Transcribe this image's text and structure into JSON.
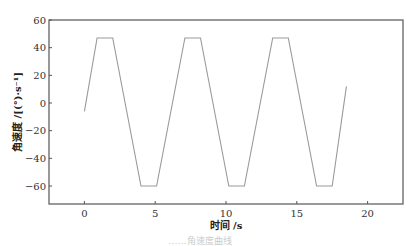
{
  "chart_data": {
    "type": "line",
    "title": "",
    "xlabel": "时间 /s",
    "ylabel": "角速度 /[(°)·s⁻¹]",
    "xlim": [
      -2.5,
      22.5
    ],
    "ylim": [
      -73,
      60
    ],
    "xticks": [
      0,
      5,
      10,
      15,
      20
    ],
    "yticks": [
      60,
      40,
      20,
      0,
      -20,
      -40,
      -60
    ],
    "grid": false,
    "legend": null,
    "series": [
      {
        "name": "angular velocity",
        "color": "#9a9a9a",
        "x": [
          0.0,
          0.9,
          2.0,
          4.0,
          5.1,
          7.1,
          8.2,
          10.2,
          11.3,
          13.3,
          14.4,
          16.4,
          17.5,
          18.5
        ],
        "y": [
          -6,
          47,
          47,
          -60,
          -60,
          47,
          47,
          -60,
          -60,
          47,
          47,
          -60,
          -60,
          12
        ]
      }
    ]
  },
  "caption": "……角速度曲线"
}
